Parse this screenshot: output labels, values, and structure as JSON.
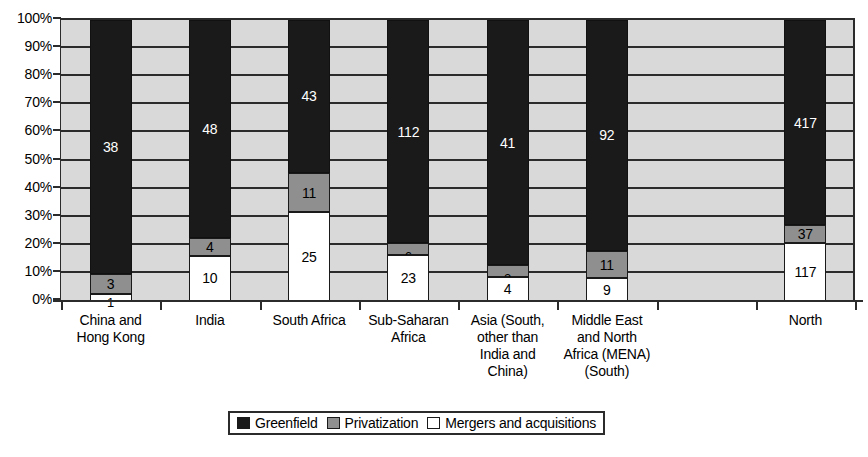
{
  "chart_data": {
    "type": "bar",
    "subtype": "stacked-100-percent",
    "title": "",
    "xlabel": "",
    "ylabel": "",
    "ylim": [
      0,
      100
    ],
    "ytick_labels": [
      "0%",
      "10%",
      "20%",
      "30%",
      "40%",
      "50%",
      "60%",
      "70%",
      "80%",
      "90%",
      "100%"
    ],
    "ytick_values": [
      0,
      10,
      20,
      30,
      40,
      50,
      60,
      70,
      80,
      90,
      100
    ],
    "grid": true,
    "legend_position": "bottom-center",
    "categories": [
      "China and Hong Kong",
      "India",
      "South Africa",
      "Sub-Saharan Africa",
      "Asia (South, other than India and China)",
      "Middle East and North Africa (MENA) (South)",
      "North"
    ],
    "category_lines": [
      [
        "China and",
        "Hong Kong"
      ],
      [
        "India"
      ],
      [
        "South Africa"
      ],
      [
        "Sub-Saharan",
        "Africa"
      ],
      [
        "Asia (South,",
        "other than",
        "India and",
        "China)"
      ],
      [
        "Middle East",
        "and North",
        "Africa (MENA)",
        "(South)"
      ],
      [
        "North"
      ]
    ],
    "series": [
      {
        "name": "Greenfield",
        "color": "#1a1a1a",
        "values": [
          38,
          48,
          43,
          112,
          41,
          92,
          417
        ]
      },
      {
        "name": "Privatization",
        "color": "#8f8f8f",
        "values": [
          3,
          4,
          11,
          6,
          2,
          11,
          37
        ]
      },
      {
        "name": "Mergers and acquisitions",
        "color": "#ffffff",
        "values": [
          1,
          10,
          25,
          23,
          4,
          9,
          117
        ]
      }
    ],
    "stack_order_bottom_to_top": [
      "Mergers and acquisitions",
      "Privatization",
      "Greenfield"
    ]
  },
  "legend": {
    "items": [
      {
        "label": "Greenfield",
        "swatch": "greenfield"
      },
      {
        "label": "Privatization",
        "swatch": "privatization"
      },
      {
        "label": "Mergers and acquisitions",
        "swatch": "mergers"
      }
    ]
  },
  "colors": {
    "greenfield": "#1a1a1a",
    "privatization": "#8f8f8f",
    "mergers": "#ffffff",
    "plot_background": "#d9d9d9",
    "axis": "#2b2b2b"
  }
}
